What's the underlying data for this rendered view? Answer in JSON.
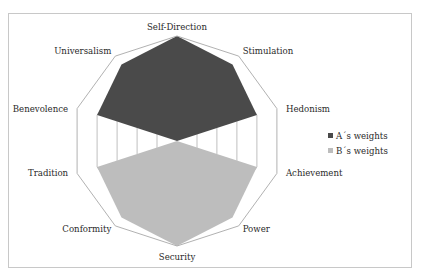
{
  "chart_data": {
    "type": "radar",
    "title": "",
    "categories": [
      "Self-Direction",
      "Stimulation",
      "Hedonism",
      "Achievement",
      "Power",
      "Security",
      "Conformity",
      "Tradition",
      "Benevolence",
      "Universalism"
    ],
    "series": [
      {
        "name": "A´s weights",
        "color": "#4a4a4a",
        "values": [
          1.0,
          0.9,
          0.8,
          0,
          0,
          0,
          0,
          0,
          0.8,
          0.9
        ]
      },
      {
        "name": "B´s weights",
        "color": "#bdbdbd",
        "values": [
          0,
          0,
          0,
          0.8,
          0.9,
          1.0,
          0.9,
          0.8,
          0,
          0
        ]
      }
    ],
    "grid_levels": [
      0.2,
      0.4,
      0.6,
      0.8,
      1.0
    ],
    "range": [
      0,
      1.0
    ],
    "grid": true,
    "legend_position": "right",
    "axis_tick_labels_visible": false
  },
  "legend": {
    "items": [
      {
        "label": "A´s weights",
        "color": "#4a4a4a"
      },
      {
        "label": "B´s weights",
        "color": "#bdbdbd"
      }
    ]
  },
  "colors": {
    "grid": "#b8b8b8",
    "frame": "#c8c8c8",
    "text": "#2a2a2a"
  }
}
